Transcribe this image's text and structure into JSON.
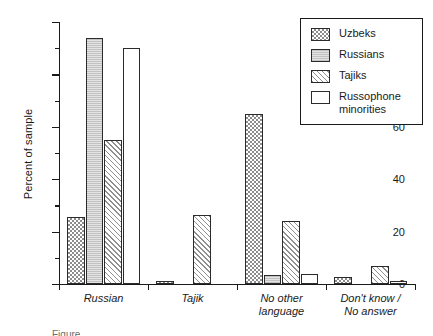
{
  "chart_data": {
    "type": "bar",
    "title": "",
    "xlabel": "",
    "ylabel": "Percent of sample",
    "ylim": [
      0,
      100
    ],
    "yticks": [
      0,
      20,
      40,
      60,
      80,
      100
    ],
    "yminorticks": [
      10,
      30,
      50,
      70,
      90
    ],
    "grid": false,
    "legend_position": "top-right",
    "categories": [
      "Russian",
      "Tajik",
      "No other\nlanguage",
      "Don't know /\nNo answer"
    ],
    "series": [
      {
        "name": "Uzbeks",
        "pattern": "checkerboard",
        "values": [
          25.5,
          1.0,
          65.0,
          2.5
        ]
      },
      {
        "name": "Russians",
        "pattern": "solid-gray",
        "values": [
          94.0,
          0.0,
          3.5,
          0.0
        ]
      },
      {
        "name": "Tajiks",
        "pattern": "diagonal-hatch",
        "values": [
          55.0,
          26.5,
          24.0,
          7.0
        ]
      },
      {
        "name": "Russophone\nminorities",
        "pattern": "white",
        "values": [
          90.0,
          0.0,
          4.0,
          1.0
        ]
      }
    ]
  },
  "legend": {
    "entries": [
      "Uzbeks",
      "Russians",
      "Tajiks",
      "Russophone\nminorities"
    ]
  },
  "caption": {
    "text": "Figure"
  }
}
